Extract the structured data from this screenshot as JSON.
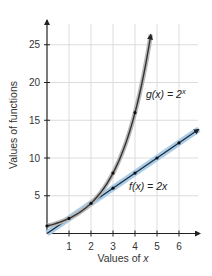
{
  "chart_data": {
    "type": "line",
    "title": "",
    "xlabel": "Values of x",
    "ylabel": "Values of functions",
    "xlim": [
      0,
      6.8
    ],
    "ylim": [
      0,
      27.5
    ],
    "xticks": [
      1,
      2,
      3,
      4,
      5,
      6
    ],
    "yticks": [
      5,
      10,
      15,
      20,
      25
    ],
    "grid": true,
    "series": [
      {
        "name": "f(x) = 2x",
        "label": "f(x) = 2x",
        "color": "#1f2a3a",
        "band_color": "#a9cde8",
        "x": [
          0,
          1,
          2,
          3,
          4,
          5,
          6
        ],
        "values": [
          0,
          2,
          4,
          6,
          8,
          10,
          12
        ]
      },
      {
        "name": "g(x) = 2^x",
        "label": "g(x) = 2",
        "label_sup": "x",
        "color": "#333333",
        "x": [
          0,
          1,
          2,
          3,
          4
        ],
        "values": [
          1,
          2,
          4,
          8,
          16
        ]
      }
    ]
  },
  "labels": {
    "ylabel": "Values of functions",
    "xlabel_prefix": "Values of ",
    "xlabel_var": "x",
    "f_label": "f(x) = 2x",
    "g_label": "g(x) = 2",
    "g_sup": "x"
  }
}
